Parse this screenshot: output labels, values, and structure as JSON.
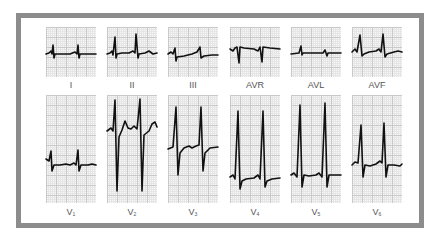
{
  "colors": {
    "frame": "#8c8c8c",
    "grid_major": "#c9c9c9",
    "grid_minor": "#e6e6e6",
    "trace": "#111111",
    "label": "#555555"
  },
  "limb_leads": [
    {
      "label": "I"
    },
    {
      "label": "II"
    },
    {
      "label": "III"
    },
    {
      "label": "AVR"
    },
    {
      "label": "AVL"
    },
    {
      "label": "AVF"
    }
  ],
  "precordial_leads": [
    {
      "label": "V",
      "sub": "1"
    },
    {
      "label": "V",
      "sub": "2"
    },
    {
      "label": "V",
      "sub": "3"
    },
    {
      "label": "V",
      "sub": "4"
    },
    {
      "label": "V",
      "sub": "5"
    },
    {
      "label": "V",
      "sub": "6"
    }
  ]
}
